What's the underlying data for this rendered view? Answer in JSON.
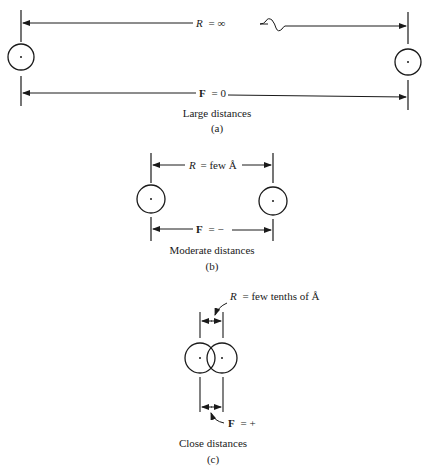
{
  "panels": {
    "a": {
      "r_label_var": "R",
      "r_label_rest": "= ∞",
      "f_label_var": "F",
      "f_label_rest": "= 0",
      "caption": "Large distances",
      "tag": "(a)"
    },
    "b": {
      "r_label_var": "R",
      "r_label_rest": "= few Å",
      "f_label_var": "F",
      "f_label_rest": "= −",
      "caption": "Moderate distances",
      "tag": "(b)"
    },
    "c": {
      "r_label_var": "R",
      "r_label_rest": "= few tenths of Å",
      "f_label_var": "F",
      "f_label_rest": "= +",
      "caption": "Close distances",
      "tag": "(c)"
    }
  },
  "colors": {
    "ink": "#1a1a1a",
    "background": "#ffffff"
  }
}
